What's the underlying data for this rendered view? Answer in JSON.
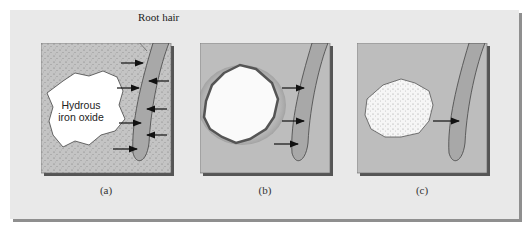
{
  "figure": {
    "labels": {
      "root_hair": "Root hair",
      "oxide_line1": "Hydrous",
      "oxide_line2": "iron oxide"
    },
    "panels": [
      {
        "id": "a",
        "caption": "(a)",
        "arrows_to_root": 4,
        "arrows_from_root": 3,
        "description": "Fresh hydrous iron oxide particle; ions move both into and out of root hair"
      },
      {
        "id": "b",
        "caption": "(b)",
        "arrows_to_root": 3,
        "arrows_from_root": 0,
        "description": "Oxide particle with dark coated rim; diffusion toward root"
      },
      {
        "id": "c",
        "caption": "(c)",
        "arrows_to_root": 1,
        "arrows_from_root": 0,
        "description": "Aged speckled oxide particle; single arrow toward root"
      }
    ],
    "colors": {
      "frame_bg": "#e9e9e9",
      "frame_shadow": "#8f8f8f",
      "panel_bg": "#bdbdbd",
      "root_fill": "#9e9e9e",
      "oxide_fill": "#ffffff",
      "rim": "#555555",
      "arrow": "#111111"
    }
  }
}
